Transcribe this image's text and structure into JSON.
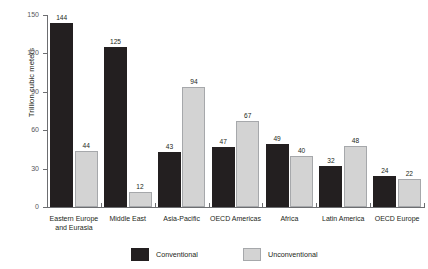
{
  "chart_data": {
    "type": "bar",
    "title": "",
    "subtitle": "",
    "xlabel": "",
    "ylabel": "Trillion cubic meters",
    "ylim": [
      0,
      150
    ],
    "yticks": [
      0,
      30,
      60,
      90,
      120,
      150
    ],
    "grid": false,
    "legend_position": "bottom",
    "categories": [
      "Eastern Europe and Eurasia",
      "Middle East",
      "Asia-Pacific",
      "OECD Americas",
      "Africa",
      "Latin America",
      "OECD Europe"
    ],
    "category_label_lines": [
      [
        "Eastern Europe",
        "and Eurasia"
      ],
      [
        "Middle East"
      ],
      [
        "Asia-Pacific"
      ],
      [
        "OECD Americas"
      ],
      [
        "Africa"
      ],
      [
        "Latin America"
      ],
      [
        "OECD Europe"
      ]
    ],
    "series": [
      {
        "name": "Conventional",
        "color": "#231f20",
        "values": [
          144,
          125,
          43,
          47,
          49,
          32,
          24
        ]
      },
      {
        "name": "Unconventional",
        "color": "#d3d3d3",
        "values": [
          44,
          12,
          94,
          67,
          40,
          48,
          22
        ]
      }
    ]
  },
  "axis": {
    "y_title": "Trillion cubic meters",
    "tick_labels": [
      "150",
      "120",
      "90",
      "60",
      "30",
      "0"
    ]
  },
  "legend": {
    "items": [
      {
        "label": "Conventional",
        "swatch": "dark-square-swatch"
      },
      {
        "label": "Unconventional",
        "swatch": "light-square-swatch"
      }
    ]
  },
  "colors": {
    "conventional": "#231f20",
    "unconventional": "#d3d3d3",
    "unconventional_border": "#a6a8ab",
    "axis": "#6d6e71",
    "tick_text": "#58595b",
    "background": "#ffffff"
  }
}
